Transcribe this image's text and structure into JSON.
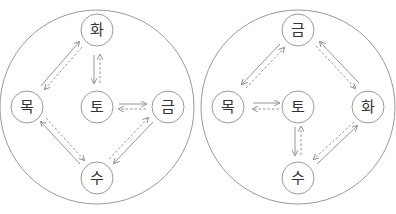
{
  "diagrams": [
    {
      "name": "left",
      "nodes": {
        "top": "화",
        "left": "목",
        "center": "토",
        "right": "금",
        "bottom": "수"
      }
    },
    {
      "name": "right",
      "nodes": {
        "top": "금",
        "left": "목",
        "center": "토",
        "right": "화",
        "bottom": "수"
      }
    }
  ],
  "colors": {
    "stroke": "#9a9a9a",
    "text": "#333333",
    "background": "#ffffff"
  }
}
